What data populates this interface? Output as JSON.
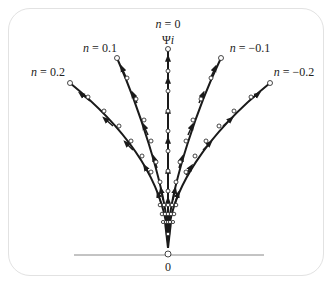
{
  "diagram": {
    "title_label": "n = 0",
    "top_label": "Ψi",
    "origin_label": "0",
    "labels": {
      "n0": {
        "var": "n",
        "eq": " = 0"
      },
      "n01": {
        "var": "n",
        "eq": " = 0.1"
      },
      "n02": {
        "var": "n",
        "eq": " = 0.2"
      },
      "nm01": {
        "var": "n",
        "eq": " = −0.1"
      },
      "nm02": {
        "var": "n",
        "eq": " = −0.2"
      },
      "psi": {
        "sym": "Ψ",
        "var": "i"
      },
      "origin": "0"
    },
    "curves": [
      {
        "n": 0.2,
        "end": [
          70,
          83
        ]
      },
      {
        "n": 0.1,
        "end": [
          117,
          58
        ]
      },
      {
        "n": 0,
        "end": [
          168,
          49
        ]
      },
      {
        "n": -0.1,
        "end": [
          221,
          58
        ]
      },
      {
        "n": -0.2,
        "end": [
          270,
          83
        ]
      }
    ],
    "origin": [
      168,
      255
    ],
    "colors": {
      "stroke": "#1a1a1a",
      "frame": "#e2e2e2",
      "baseline": "#888888"
    }
  }
}
